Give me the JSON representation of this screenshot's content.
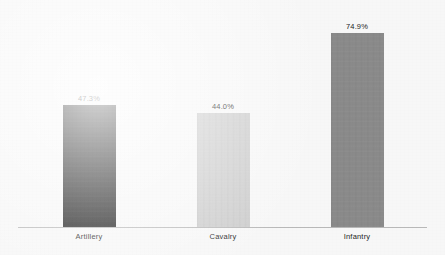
{
  "chart_data": {
    "type": "bar",
    "title": "",
    "subtitle": "",
    "xlabel": "",
    "ylabel": "",
    "categories": [
      "Artillery",
      "Cavalry",
      "Infantry"
    ],
    "values": [
      47.3,
      44.0,
      74.9
    ],
    "value_labels": [
      "47.3%",
      "44.0%",
      "74.9%"
    ],
    "bar_colors": [
      "#1a1a1a",
      "#cdcdcd",
      "#8a8a8a"
    ],
    "ylim": [
      0,
      100
    ],
    "grid": false,
    "legend": false,
    "legend_position": "none",
    "y_axis_visible": false,
    "x_axis_visible": true,
    "axis_color": "#b9b9b9",
    "background_color": "#f7f7f7",
    "label_color": "#1d1d1d",
    "units": "percent"
  },
  "bars": [
    {
      "category": "Artillery",
      "value_label": "47.3%",
      "color": "#1a1a1a"
    },
    {
      "category": "Cavalry",
      "value_label": "44.0%",
      "color": "#cdcdcd"
    },
    {
      "category": "Infantry",
      "value_label": "74.9%",
      "color": "#8a8a8a"
    }
  ]
}
